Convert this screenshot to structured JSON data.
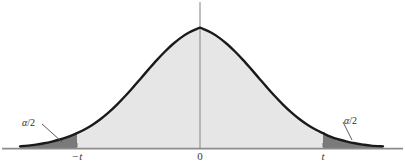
{
  "figure": {
    "kind": "t-distribution-two-tailed-critical-region",
    "width": 405,
    "height": 168
  },
  "axis": {
    "labels": [
      {
        "id": "neg-t",
        "text": "−t",
        "x": 77,
        "y": 151,
        "italic": true
      },
      {
        "id": "zero",
        "text": "0",
        "x": 200,
        "y": 151,
        "italic": false
      },
      {
        "id": "pos-t",
        "text": "t",
        "x": 323,
        "y": 151,
        "italic": true
      }
    ]
  },
  "annotations": {
    "left_tail": {
      "text_alpha": "α",
      "text_rest": "/2",
      "label_x": 22,
      "label_y": 118
    },
    "right_tail": {
      "text_alpha": "α",
      "text_rest": "/2",
      "label_x": 344,
      "label_y": 116
    }
  },
  "colors": {
    "curve_stroke": "#1a1a1a",
    "center_fill": "#e6e6e6",
    "tail_fill": "#7a7a7a",
    "baseline": "#8c8c8c",
    "center_line": "#8c8c8c",
    "leader_line": "#4a4a4a",
    "background": "#ffffff"
  },
  "chart_data": {
    "type": "area",
    "title": "",
    "xlabel": "",
    "ylabel": "",
    "distribution": "student-t",
    "grid": false,
    "legend": null,
    "baseline_y_px": 148,
    "peak_y_px": 13,
    "center_x_px": 200,
    "xlim_px": [
      20,
      383
    ],
    "critical_values": {
      "lower_label": "−t",
      "lower_x_px": 77,
      "upper_label": "t",
      "upper_x_px": 323
    },
    "regions": [
      {
        "name": "left-tail",
        "label": "α/2",
        "shade": "dark",
        "from_px": 20,
        "to_px": 77
      },
      {
        "name": "central",
        "label": "1−α",
        "shade": "light",
        "from_px": 77,
        "to_px": 323
      },
      {
        "name": "right-tail",
        "label": "α/2",
        "shade": "dark",
        "from_px": 323,
        "to_px": 383
      }
    ],
    "curve_points_px": [
      [
        20,
        146.4
      ],
      [
        28,
        145.6
      ],
      [
        36,
        144.6
      ],
      [
        44,
        143.3
      ],
      [
        52,
        141.6
      ],
      [
        60,
        139.5
      ],
      [
        68,
        136.9
      ],
      [
        77,
        133.2
      ],
      [
        85,
        129.2
      ],
      [
        93,
        124.4
      ],
      [
        101,
        118.7
      ],
      [
        109,
        112.1
      ],
      [
        117,
        104.6
      ],
      [
        125,
        96.3
      ],
      [
        133,
        87.4
      ],
      [
        141,
        78.2
      ],
      [
        149,
        68.9
      ],
      [
        157,
        59.9
      ],
      [
        165,
        51.5
      ],
      [
        173,
        44.0
      ],
      [
        181,
        37.6
      ],
      [
        189,
        32.5
      ],
      [
        197,
        28.9
      ],
      [
        200,
        27.8
      ],
      [
        203,
        28.9
      ],
      [
        211,
        32.5
      ],
      [
        219,
        37.6
      ],
      [
        227,
        44.0
      ],
      [
        235,
        51.5
      ],
      [
        243,
        59.9
      ],
      [
        251,
        68.9
      ],
      [
        259,
        78.2
      ],
      [
        267,
        87.4
      ],
      [
        275,
        96.3
      ],
      [
        283,
        104.6
      ],
      [
        291,
        112.1
      ],
      [
        299,
        118.7
      ],
      [
        307,
        124.4
      ],
      [
        315,
        129.2
      ],
      [
        323,
        133.2
      ],
      [
        331,
        136.9
      ],
      [
        339,
        139.5
      ],
      [
        347,
        141.6
      ],
      [
        355,
        143.3
      ],
      [
        363,
        144.6
      ],
      [
        371,
        145.6
      ],
      [
        383,
        146.4
      ]
    ]
  }
}
